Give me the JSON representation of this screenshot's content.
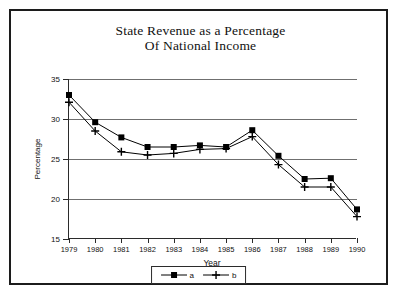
{
  "chart_data": {
    "type": "line",
    "title": "State Revenue as a Percentage Of National Income",
    "title_line1": "State Revenue as a Percentage",
    "title_line2": "Of National Income",
    "xlabel": "Year",
    "ylabel": "Percentage",
    "categories": [
      "1979",
      "1980",
      "1981",
      "1982",
      "1983",
      "1984",
      "1985",
      "1986",
      "1987",
      "1988",
      "1989",
      "1990"
    ],
    "x": [
      1979,
      1980,
      1981,
      1982,
      1983,
      1984,
      1985,
      1986,
      1987,
      1988,
      1989,
      1990
    ],
    "xlim": [
      1979,
      1990
    ],
    "ylim": [
      15,
      35
    ],
    "yticks": [
      15,
      20,
      25,
      30,
      35
    ],
    "ytick_labels": [
      "15",
      "20",
      "25",
      "30",
      "35"
    ],
    "grid": true,
    "legend_position": "bottom-center",
    "series": [
      {
        "name": "a",
        "marker": "filled-square",
        "color": "#000000",
        "values": [
          33.0,
          29.6,
          27.7,
          26.5,
          26.5,
          26.7,
          26.5,
          28.6,
          25.4,
          22.5,
          22.6,
          18.7
        ]
      },
      {
        "name": "b",
        "marker": "plus",
        "color": "#000000",
        "values": [
          32.1,
          28.5,
          25.9,
          25.5,
          25.7,
          26.2,
          26.3,
          27.8,
          24.3,
          21.5,
          21.5,
          17.8
        ]
      }
    ]
  },
  "legend": {
    "entries": [
      {
        "label": "a"
      },
      {
        "label": "b"
      }
    ]
  }
}
